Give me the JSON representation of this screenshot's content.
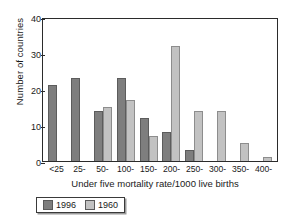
{
  "chart_data": {
    "type": "bar",
    "title": "",
    "xlabel": "Under five mortality rate/1000 live births",
    "ylabel": "Number of countries",
    "categories": [
      "<25",
      "25-",
      "50-",
      "100-",
      "150-",
      "200-",
      "250-",
      "300-",
      "350-",
      "400-"
    ],
    "series": [
      {
        "name": "1996",
        "color": "#7e7e7e",
        "values": [
          21,
          23,
          14,
          23,
          12,
          8,
          3,
          0,
          0,
          0
        ]
      },
      {
        "name": "1960",
        "color": "#c2c2c2",
        "values": [
          0,
          0,
          15,
          17,
          7,
          32,
          14,
          14,
          5,
          1
        ]
      }
    ],
    "ylim": [
      0,
      40
    ],
    "yticks": [
      "0",
      "10",
      "20",
      "30",
      "40"
    ],
    "ytick_values": [
      0,
      10,
      20,
      30,
      40
    ],
    "grid": false,
    "legend_position": "bottom-left"
  },
  "legend": {
    "items": [
      {
        "label": "1996"
      },
      {
        "label": "1960"
      }
    ]
  }
}
